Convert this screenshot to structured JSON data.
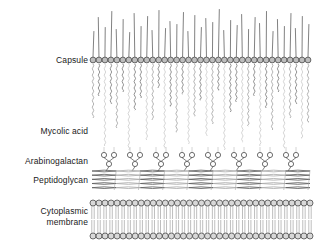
{
  "figure": {
    "background_color": "#ffffff",
    "width": 329,
    "height": 251
  },
  "labels": {
    "capsule": "Capsule",
    "mycolic_acid": "Mycolic acid",
    "arabinogalactan": "Arabinogalactan",
    "peptidoglycan": "Peptidoglycan",
    "cytoplasmic_membrane_line1": "Cytoplasmic",
    "cytoplasmic_membrane_line2": "membrane"
  },
  "colors": {
    "outline": "#4a4a4a",
    "head_fill": "#bdbdbd",
    "head_fill_light": "#d8d8d8",
    "chain_dark": "#6e6e6e",
    "chain_mid": "#9a9a9a",
    "chain_light": "#c6c6c6",
    "peptido_dark": "#5a5a5a",
    "peptido_light": "#a8a8a8",
    "text": "#1a1a1a"
  },
  "layers": {
    "capsule": {
      "name": "capsule",
      "head_row_y": 60,
      "head_count": 37,
      "x_start": 93,
      "x_end": 308,
      "head_radius": 2.9,
      "stalk_heights": [
        26,
        40,
        30,
        46,
        28,
        38,
        25,
        44,
        31,
        41,
        27,
        47,
        29,
        36,
        33,
        45,
        26,
        42,
        30,
        39,
        35,
        48,
        27,
        37,
        32,
        43,
        28,
        40,
        34,
        46,
        26,
        38,
        31,
        44,
        29,
        41,
        33
      ]
    },
    "mycolic_acid": {
      "name": "mycolic-acid",
      "chain_top_y": 64,
      "chain_count": 37,
      "chain_bottom_ys": [
        118,
        96,
        146,
        104,
        128,
        92,
        150,
        110,
        98,
        140,
        120,
        88,
        148,
        106,
        132,
        94,
        144,
        116,
        100,
        136,
        124,
        90,
        150,
        112,
        102,
        142,
        126,
        96,
        146,
        108,
        130,
        92,
        148,
        118,
        104,
        138,
        122
      ],
      "bead_pitch": 3.2,
      "bead_amplitude": 1.5
    },
    "arabinogalactan": {
      "name": "arabinogalactan",
      "unit_count": 8,
      "unit_x_centers": [
        109,
        135,
        161,
        187,
        213,
        239,
        265,
        291
      ],
      "fork_circle_y": 155,
      "stem_circle_y": 164,
      "attach_y": 171,
      "circle_radius": 2.6,
      "fork_half_width": 5
    },
    "peptidoglycan": {
      "name": "peptidoglycan",
      "x_start": 92,
      "x_end": 310,
      "y_top": 170,
      "y_bottom": 190,
      "strand_rows": 5,
      "bundle_count": 9,
      "bundle_shades": [
        "dark",
        "light",
        "dark",
        "light",
        "dark",
        "light",
        "dark",
        "light",
        "dark"
      ]
    },
    "cytoplasmic_membrane": {
      "name": "cytoplasmic-membrane",
      "x_start": 93,
      "x_end": 310,
      "head_top_y": 203,
      "head_bottom_y": 236,
      "head_count": 37,
      "head_radius": 3.0,
      "tail_offset": 1.2
    }
  }
}
